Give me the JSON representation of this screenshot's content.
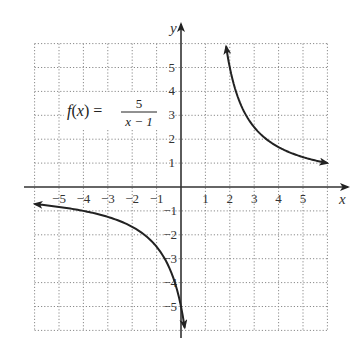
{
  "chart_data": {
    "type": "line",
    "title": "",
    "function_label": {
      "lhs": "f(x) =",
      "numerator": "5",
      "denominator": "x − 1"
    },
    "xlabel": "x",
    "ylabel": "y",
    "xlim": [
      -6,
      6
    ],
    "ylim": [
      -6,
      6
    ],
    "grid": true,
    "grid_style": "dotted",
    "x_ticks": [
      -5,
      -4,
      -3,
      -2,
      -1,
      1,
      2,
      3,
      4,
      5
    ],
    "y_ticks": [
      -5,
      -3,
      -2,
      -1,
      1,
      2,
      3,
      4,
      5
    ],
    "x_tick_labels": [
      "−5",
      "−4",
      "−3",
      "−2",
      "−1",
      "1",
      "2",
      "3",
      "4",
      "5"
    ],
    "y_tick_labels_pos": [
      "1",
      "2",
      "3",
      "4",
      "5"
    ],
    "y_tick_labels_neg": [
      "−1",
      "−2",
      "−3",
      "−4",
      "−5"
    ],
    "vertical_asymptote": 1,
    "horizontal_asymptote": 0,
    "series": [
      {
        "name": "right branch",
        "x": [
          1.85,
          2,
          2.5,
          3,
          3.5,
          4,
          4.5,
          5,
          5.5,
          6
        ],
        "y": [
          5.88,
          5,
          3.33,
          2.5,
          2,
          1.67,
          1.43,
          1.25,
          1.11,
          1
        ],
        "arrows": "both"
      },
      {
        "name": "left branch",
        "x": [
          -6,
          -5.5,
          -5,
          -4,
          -3,
          -2,
          -1.5,
          -1,
          -0.5,
          0,
          0.15
        ],
        "y": [
          -0.71,
          -0.77,
          -0.83,
          -1,
          -1.25,
          -1.67,
          -2,
          -2.5,
          -3.33,
          -5,
          -5.88
        ],
        "arrows": "both"
      }
    ]
  },
  "colors": {
    "curve": "#222222",
    "axis": "#333333",
    "grid": "#8a8a8a",
    "background": "#ffffff"
  }
}
